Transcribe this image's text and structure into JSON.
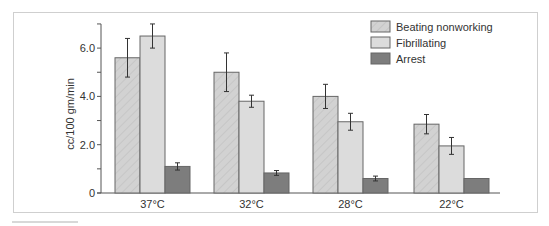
{
  "chart_data": {
    "type": "bar",
    "title": "",
    "xlabel": "",
    "ylabel": "cc/100 gm/min",
    "ylim": [
      0,
      7
    ],
    "yticks": [
      {
        "value": 0,
        "label": "0"
      },
      {
        "value": 1,
        "label": ""
      },
      {
        "value": 2,
        "label": "2.0"
      },
      {
        "value": 3,
        "label": ""
      },
      {
        "value": 4,
        "label": "4.0"
      },
      {
        "value": 5,
        "label": ""
      },
      {
        "value": 6,
        "label": "6.0"
      },
      {
        "value": 7,
        "label": ""
      }
    ],
    "categories": [
      "37°C",
      "32°C",
      "28°C",
      "22°C"
    ],
    "series": [
      {
        "name": "Beating nonworking",
        "values": [
          5.6,
          5.0,
          4.0,
          2.85
        ],
        "errors": [
          0.8,
          0.8,
          0.5,
          0.4
        ],
        "color": "#d2d2d2",
        "hatched": true
      },
      {
        "name": "Fibrillating",
        "values": [
          6.5,
          3.8,
          2.95,
          1.95
        ],
        "errors": [
          0.5,
          0.25,
          0.35,
          0.35
        ],
        "color": "#dcdcdc",
        "hatched": false
      },
      {
        "name": "Arrest",
        "values": [
          1.1,
          0.83,
          0.6,
          0.6
        ],
        "errors": [
          0.15,
          0.1,
          0.1,
          0
        ],
        "color": "#7d7d7d",
        "hatched": false
      }
    ],
    "legend_position": "upper-right",
    "grid": false
  }
}
